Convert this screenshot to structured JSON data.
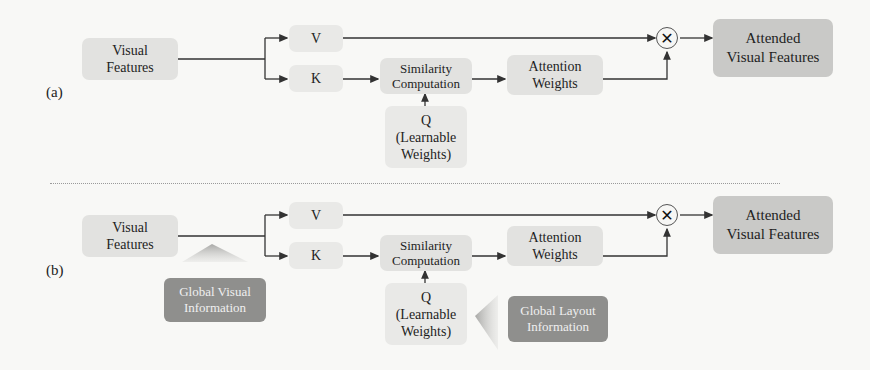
{
  "panels": [
    {
      "label": "(a)",
      "visual_features": "Visual\nFeatures",
      "v": "V",
      "k": "K",
      "similarity": "Similarity\nComputation",
      "q": "Q\n(Learnable\nWeights)",
      "attention_weights": "Attention\nWeights",
      "multiply_symbol": "✕",
      "output": "Attended\nVisual Features"
    },
    {
      "label": "(b)",
      "visual_features": "Visual\nFeatures",
      "v": "V",
      "k": "K",
      "similarity": "Similarity\nComputation",
      "q": "Q\n(Learnable\nWeights)",
      "attention_weights": "Attention\nWeights",
      "multiply_symbol": "✕",
      "output": "Attended\nVisual Features",
      "global_visual": "Global Visual\nInformation",
      "global_layout": "Global Layout\nInformation"
    }
  ],
  "colors": {
    "background": "#f8f8f6",
    "box": "#e2e2e0",
    "output_box": "#c9c9c7",
    "global_box": "#8f8f8d",
    "line": "#333333"
  }
}
